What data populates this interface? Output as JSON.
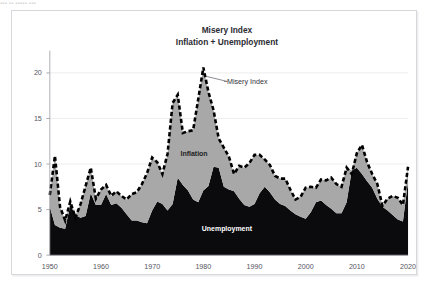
{
  "caption_strip": "▪▪▪ ▪▪ ▪▪▪▪▪ ▪▪▪",
  "chart": {
    "title_line1": "Misery Index",
    "title_line2": "Inflation + Unemployment",
    "annotation_misery": "Misery Index",
    "annotation_inflation": "Inflation",
    "annotation_unemployment": "Unemployment",
    "colors": {
      "unemployment_fill": "#0b0b0d",
      "inflation_fill": "#a8a8a8",
      "misery_line": "#000000",
      "gridline": "#e8e8ec",
      "axis_text": "#55555e",
      "frame_border": "#d8d8dc",
      "background": "#ffffff"
    }
  },
  "chart_data": {
    "type": "area",
    "xlabel": "",
    "ylabel": "",
    "xlim": [
      1950,
      2020
    ],
    "ylim": [
      0,
      22
    ],
    "yticks": [
      0,
      5,
      10,
      15,
      20
    ],
    "xticks": [
      1950,
      1960,
      1970,
      1980,
      1990,
      2000,
      2010,
      2020
    ],
    "grid": true,
    "legend": "in-chart annotations",
    "stacked": true,
    "x": [
      1950,
      1951,
      1952,
      1953,
      1954,
      1955,
      1956,
      1957,
      1958,
      1959,
      1960,
      1961,
      1962,
      1963,
      1964,
      1965,
      1966,
      1967,
      1968,
      1969,
      1970,
      1971,
      1972,
      1973,
      1974,
      1975,
      1976,
      1977,
      1978,
      1979,
      1980,
      1981,
      1982,
      1983,
      1984,
      1985,
      1986,
      1987,
      1988,
      1989,
      1990,
      1991,
      1992,
      1993,
      1994,
      1995,
      1996,
      1997,
      1998,
      1999,
      2000,
      2001,
      2002,
      2003,
      2004,
      2005,
      2006,
      2007,
      2008,
      2009,
      2010,
      2011,
      2012,
      2013,
      2014,
      2015,
      2016,
      2017,
      2018,
      2019,
      2020
    ],
    "series": [
      {
        "name": "Unemployment",
        "color": "#0b0b0d",
        "values": [
          5.3,
          3.3,
          3.0,
          2.9,
          5.5,
          4.4,
          4.1,
          4.3,
          6.8,
          5.5,
          5.5,
          6.7,
          5.5,
          5.7,
          5.2,
          4.5,
          3.8,
          3.8,
          3.6,
          3.5,
          4.9,
          5.9,
          5.6,
          4.9,
          5.6,
          8.5,
          7.7,
          7.1,
          6.1,
          5.8,
          7.1,
          7.6,
          9.7,
          9.6,
          7.5,
          7.2,
          7.0,
          6.2,
          5.5,
          5.3,
          5.6,
          6.8,
          7.5,
          6.9,
          6.1,
          5.6,
          5.4,
          4.9,
          4.5,
          4.2,
          4.0,
          4.7,
          5.8,
          6.0,
          5.5,
          5.1,
          4.6,
          4.6,
          5.8,
          9.3,
          9.6,
          8.9,
          8.1,
          7.4,
          6.2,
          5.3,
          4.9,
          4.4,
          3.9,
          3.7,
          8.1
        ]
      },
      {
        "name": "Inflation",
        "color": "#a8a8a8",
        "values": [
          1.3,
          7.6,
          2.3,
          0.9,
          0.4,
          -0.3,
          1.5,
          3.3,
          2.8,
          0.7,
          1.7,
          1.0,
          1.0,
          1.3,
          1.3,
          1.6,
          2.9,
          3.1,
          4.2,
          5.5,
          5.8,
          4.3,
          3.3,
          6.2,
          11.1,
          9.1,
          5.7,
          6.5,
          7.6,
          11.3,
          13.5,
          10.3,
          6.2,
          3.2,
          4.3,
          3.6,
          1.9,
          3.6,
          4.1,
          4.8,
          5.4,
          4.2,
          3.0,
          3.0,
          2.6,
          2.8,
          3.0,
          2.3,
          1.6,
          2.2,
          3.4,
          2.8,
          1.6,
          2.3,
          2.7,
          3.4,
          3.2,
          2.9,
          3.8,
          -0.4,
          1.6,
          3.2,
          2.1,
          1.5,
          1.6,
          0.1,
          1.3,
          2.1,
          2.4,
          1.8,
          1.6
        ]
      }
    ],
    "misery_index": {
      "name": "Misery Index",
      "style": "dashed",
      "values": [
        6.6,
        10.9,
        5.3,
        3.8,
        5.9,
        4.1,
        5.6,
        7.6,
        9.6,
        6.2,
        7.2,
        7.7,
        6.5,
        7.0,
        6.5,
        6.1,
        6.7,
        6.9,
        7.8,
        9.0,
        10.7,
        10.2,
        8.9,
        11.1,
        16.7,
        17.6,
        13.4,
        13.6,
        13.7,
        17.1,
        20.6,
        17.9,
        15.9,
        12.8,
        11.8,
        10.8,
        8.9,
        9.8,
        9.6,
        10.1,
        11.0,
        11.0,
        10.5,
        9.9,
        8.7,
        8.4,
        8.4,
        7.2,
        6.1,
        6.4,
        7.4,
        7.5,
        7.4,
        8.3,
        8.2,
        8.5,
        7.8,
        7.5,
        9.6,
        8.9,
        11.2,
        12.1,
        10.2,
        8.9,
        7.8,
        5.4,
        6.2,
        6.5,
        6.3,
        5.5,
        9.7
      ]
    }
  }
}
